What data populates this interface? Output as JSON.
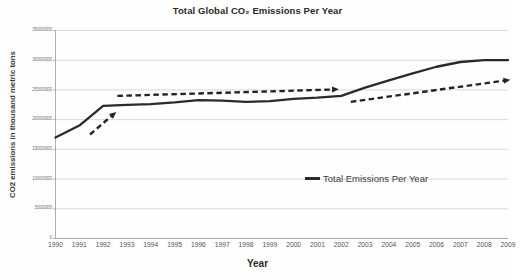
{
  "chart_data": {
    "type": "line",
    "title": "Total Global CO₂ Emissions Per Year",
    "xlabel": "Year",
    "ylabel": "CO2 emissions in thousand metric tons",
    "grid": true,
    "legend_position": "inside-right",
    "x": [
      1990,
      1991,
      1992,
      1993,
      1994,
      1995,
      1996,
      1997,
      1998,
      1999,
      2000,
      2001,
      2002,
      2003,
      2004,
      2005,
      2006,
      2007,
      2008,
      2009
    ],
    "categories": [
      "1990",
      "1991",
      "1992",
      "1993",
      "1994",
      "1995",
      "1996",
      "1997",
      "1998",
      "1999",
      "2000",
      "2001",
      "2002",
      "2003",
      "2004",
      "2005",
      "2006",
      "2007",
      "2008",
      "2009"
    ],
    "series": [
      {
        "name": "Total Emissions Per Year",
        "color": "#2a2a2a",
        "style": "solid",
        "values": [
          17000000,
          19000000,
          22300000,
          22500000,
          22600000,
          22900000,
          23300000,
          23200000,
          23000000,
          23100000,
          23500000,
          23700000,
          24000000,
          25400000,
          26600000,
          27800000,
          28900000,
          29700000,
          30000000,
          30000000
        ]
      }
    ],
    "ylim": [
      0,
      35000000
    ],
    "ytick_values": [
      0,
      5000000,
      10000000,
      15000000,
      20000000,
      25000000,
      30000000,
      35000000
    ],
    "ytick_labels": [
      "0",
      "5000000",
      "10000000",
      "15000000",
      "20000000",
      "25000000",
      "30000000",
      "35000000"
    ],
    "annotations": [
      {
        "name": "trend-arrow-early-rise",
        "type": "dashed-arrow",
        "from": {
          "x": 1991.45,
          "y": 17500000
        },
        "to": {
          "x": 1992.55,
          "y": 21300000
        }
      },
      {
        "name": "trend-arrow-plateau",
        "type": "dashed-arrow",
        "from": {
          "x": 1992.6,
          "y": 24000000
        },
        "to": {
          "x": 2001.9,
          "y": 25100000
        }
      },
      {
        "name": "trend-arrow-late-rise",
        "type": "dashed-arrow",
        "from": {
          "x": 2002.4,
          "y": 23000000
        },
        "to": {
          "x": 2009.1,
          "y": 26700000
        }
      }
    ]
  },
  "legend": {
    "entries": [
      {
        "label": "Total Emissions Per Year"
      }
    ]
  }
}
